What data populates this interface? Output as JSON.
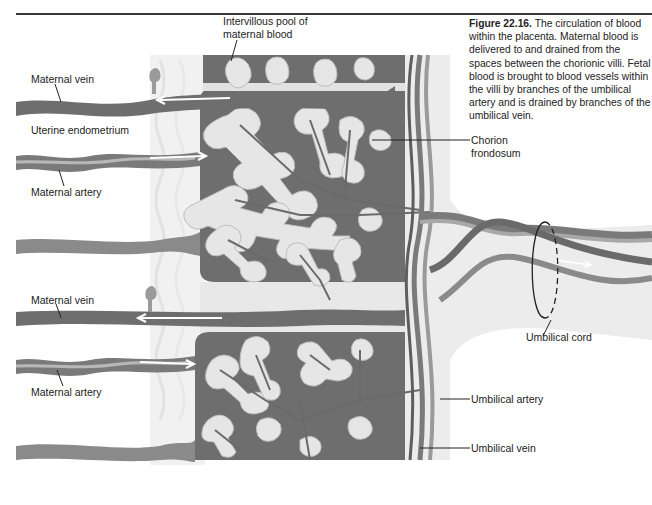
{
  "figure": {
    "number": "Figure 22.16.",
    "caption": "The circulation of blood within the placenta. Maternal blood is delivered to and drained from the spaces between the chorionic villi. Fetal blood is brought to blood vessels within the villi by branches of the umbilical artery and is drained by branches of the umbilical vein."
  },
  "labels": {
    "intervillous_pool_line1": "Intervillous pool of",
    "intervillous_pool_line2": "maternal blood",
    "maternal_vein_top": "Maternal vein",
    "uterine_endometrium": "Uterine endometrium",
    "maternal_artery_top": "Maternal artery",
    "chorion_frondosum_line1": "Chorion",
    "chorion_frondosum_line2": "frondosum",
    "umbilical_cord": "Umbilical cord",
    "maternal_vein_bottom": "Maternal vein",
    "maternal_artery_bottom": "Maternal artery",
    "umbilical_artery": "Umbilical artery",
    "umbilical_vein": "Umbilical vein"
  },
  "colors": {
    "background": "#ffffff",
    "pool": "#6e6e6e",
    "villus": "#e6e6e6",
    "vessel_dark": "#5a5a5a",
    "vessel_mid": "#8a8a8a",
    "endometrium_haze": "#eeeeee",
    "text": "#222222"
  }
}
